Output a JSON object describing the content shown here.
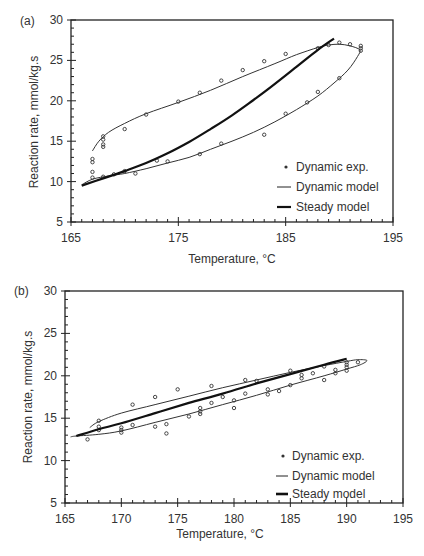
{
  "chart_data": [
    {
      "panel_label": "(a)",
      "type": "scatter",
      "xlabel": "Temperature, °C",
      "ylabel": "Reaction rate, mmol/kg.s",
      "xlim": [
        165,
        195
      ],
      "ylim": [
        5,
        30
      ],
      "xticks": [
        165,
        175,
        185,
        195
      ],
      "yticks": [
        5,
        10,
        15,
        20,
        25,
        30
      ],
      "grid": false,
      "legend_position": "bottom-right",
      "legend": [
        {
          "key": "exp",
          "label": "Dynamic exp."
        },
        {
          "key": "dyn",
          "label": "Dynamic model"
        },
        {
          "key": "steady",
          "label": "Steady model"
        }
      ],
      "series": [
        {
          "name": "Dynamic exp.",
          "kind": "points",
          "points": [
            [
              167,
              12.8
            ],
            [
              167,
              12.4
            ],
            [
              167,
              11.2
            ],
            [
              167,
              10.5
            ],
            [
              168,
              15.6
            ],
            [
              168,
              15.2
            ],
            [
              168,
              14.6
            ],
            [
              168,
              14.3
            ],
            [
              168,
              10.6
            ],
            [
              169,
              10.9
            ],
            [
              170,
              16.5
            ],
            [
              170,
              11.3
            ],
            [
              171,
              11.0
            ],
            [
              172,
              18.3
            ],
            [
              173,
              12.6
            ],
            [
              174,
              12.5
            ],
            [
              175,
              19.9
            ],
            [
              177,
              13.4
            ],
            [
              177,
              21.0
            ],
            [
              179,
              14.7
            ],
            [
              179,
              22.5
            ],
            [
              181,
              23.8
            ],
            [
              183,
              15.8
            ],
            [
              183,
              24.9
            ],
            [
              185,
              18.4
            ],
            [
              185,
              25.8
            ],
            [
              187,
              19.8
            ],
            [
              188,
              21.1
            ],
            [
              188,
              26.5
            ],
            [
              189,
              26.9
            ],
            [
              190,
              27.2
            ],
            [
              190,
              22.8
            ],
            [
              191,
              27.0
            ],
            [
              192,
              26.8
            ],
            [
              192,
              26.5
            ],
            [
              192,
              26.2
            ]
          ]
        },
        {
          "name": "Dynamic model",
          "kind": "loop",
          "points": [
            [
              167.0,
              13.8
            ],
            [
              167.6,
              15.0
            ],
            [
              168.5,
              16.1
            ],
            [
              170,
              17.2
            ],
            [
              172,
              18.4
            ],
            [
              175,
              19.8
            ],
            [
              178,
              21.3
            ],
            [
              181,
              23.0
            ],
            [
              184,
              24.6
            ],
            [
              186,
              25.7
            ],
            [
              188,
              26.6
            ],
            [
              189,
              26.9
            ],
            [
              190,
              27.0
            ],
            [
              191,
              26.8
            ],
            [
              191.9,
              26.3
            ],
            [
              191.7,
              25.5
            ],
            [
              190.8,
              23.8
            ],
            [
              189.5,
              22.2
            ],
            [
              188,
              20.6
            ],
            [
              186,
              18.9
            ],
            [
              184,
              17.4
            ],
            [
              182,
              16.1
            ],
            [
              180,
              15.0
            ],
            [
              178,
              14.0
            ],
            [
              176,
              13.0
            ],
            [
              174,
              12.3
            ],
            [
              172,
              11.6
            ],
            [
              170,
              11.0
            ],
            [
              168.5,
              10.7
            ],
            [
              167,
              10.3
            ],
            [
              166,
              9.6
            ]
          ]
        },
        {
          "name": "Steady model",
          "kind": "line",
          "points": [
            [
              166,
              9.5
            ],
            [
              168,
              10.4
            ],
            [
              170,
              11.3
            ],
            [
              172,
              12.3
            ],
            [
              174,
              13.5
            ],
            [
              176,
              14.9
            ],
            [
              178,
              16.5
            ],
            [
              180,
              18.2
            ],
            [
              182,
              20.1
            ],
            [
              184,
              22.1
            ],
            [
              186,
              24.2
            ],
            [
              188,
              26.3
            ],
            [
              189.5,
              27.7
            ]
          ]
        }
      ]
    },
    {
      "panel_label": "(b)",
      "type": "scatter",
      "xlabel": "Temperature, °C",
      "ylabel": "Reaction rate, mmol/kg.s",
      "xlim": [
        165,
        195
      ],
      "ylim": [
        5,
        30
      ],
      "xticks": [
        165,
        170,
        175,
        180,
        185,
        190,
        195
      ],
      "yticks": [
        5,
        10,
        15,
        20,
        25,
        30
      ],
      "grid": false,
      "legend_position": "bottom-right",
      "legend": [
        {
          "key": "exp",
          "label": "Dynamic exp."
        },
        {
          "key": "dyn",
          "label": "Dynamic model"
        },
        {
          "key": "steady",
          "label": "Steady model"
        }
      ],
      "series": [
        {
          "name": "Dynamic exp.",
          "kind": "points",
          "points": [
            [
              167,
              12.5
            ],
            [
              168,
              14.7
            ],
            [
              168,
              14.0
            ],
            [
              168,
              13.6
            ],
            [
              170,
              13.9
            ],
            [
              170,
              13.6
            ],
            [
              170,
              13.3
            ],
            [
              171,
              14.2
            ],
            [
              171,
              16.6
            ],
            [
              173,
              14.0
            ],
            [
              173,
              17.5
            ],
            [
              174,
              13.2
            ],
            [
              174,
              14.3
            ],
            [
              175,
              18.4
            ],
            [
              176,
              15.2
            ],
            [
              177,
              16.2
            ],
            [
              177,
              15.8
            ],
            [
              177,
              15.5
            ],
            [
              178,
              18.8
            ],
            [
              178,
              16.8
            ],
            [
              179,
              17.5
            ],
            [
              180,
              16.2
            ],
            [
              180,
              17.1
            ],
            [
              181,
              17.9
            ],
            [
              181,
              19.5
            ],
            [
              182,
              19.4
            ],
            [
              183,
              18.4
            ],
            [
              183,
              17.8
            ],
            [
              184,
              18.2
            ],
            [
              185,
              18.9
            ],
            [
              185,
              20.6
            ],
            [
              186,
              20.1
            ],
            [
              186,
              19.7
            ],
            [
              187,
              20.3
            ],
            [
              188,
              19.5
            ],
            [
              188,
              21.1
            ],
            [
              189,
              20.7
            ],
            [
              189,
              20.3
            ],
            [
              190,
              21.6
            ],
            [
              190,
              21.3
            ],
            [
              190,
              21.0
            ],
            [
              190,
              20.6
            ],
            [
              191,
              21.6
            ]
          ]
        },
        {
          "name": "Dynamic model",
          "kind": "loop",
          "points": [
            [
              167.2,
              13.9
            ],
            [
              168,
              14.6
            ],
            [
              170,
              15.6
            ],
            [
              173,
              16.6
            ],
            [
              176,
              17.6
            ],
            [
              179,
              18.6
            ],
            [
              182,
              19.5
            ],
            [
              185,
              20.4
            ],
            [
              188,
              21.2
            ],
            [
              190,
              21.7
            ],
            [
              191,
              21.9
            ],
            [
              191.8,
              21.8
            ],
            [
              191.2,
              21.3
            ],
            [
              190,
              20.8
            ],
            [
              188,
              20.0
            ],
            [
              185,
              18.9
            ],
            [
              182,
              17.7
            ],
            [
              179,
              16.6
            ],
            [
              176,
              15.5
            ],
            [
              173,
              14.5
            ],
            [
              170,
              13.5
            ],
            [
              168,
              13.1
            ],
            [
              166,
              12.9
            ],
            [
              165.5,
              12.8
            ]
          ]
        },
        {
          "name": "Steady model",
          "kind": "line",
          "points": [
            [
              166,
              12.9
            ],
            [
              168,
              13.7
            ],
            [
              170,
              14.4
            ],
            [
              173,
              15.6
            ],
            [
              176,
              16.8
            ],
            [
              179,
              17.9
            ],
            [
              182,
              19.1
            ],
            [
              185,
              20.2
            ],
            [
              188,
              21.3
            ],
            [
              190,
              22.0
            ]
          ]
        }
      ]
    }
  ]
}
